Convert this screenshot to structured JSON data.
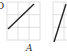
{
  "figure": {
    "panels": [
      {
        "label": "A",
        "grid": {
          "x0": 7,
          "y0": 2,
          "x1": 40,
          "y1": 40,
          "cols": 3,
          "rows": 3
        },
        "line": {
          "x1": 8,
          "y1": 29,
          "x2": 34,
          "y2": 4
        }
      },
      {
        "label": "",
        "grid": {
          "x0": 53,
          "y0": 2,
          "x1": 86,
          "y1": 40,
          "cols": 3,
          "rows": 3
        },
        "line": {
          "x1": 54,
          "y1": 42,
          "x2": 66,
          "y2": 4
        }
      }
    ],
    "cropped_glyph": "D",
    "colors": {
      "grid": "#d8d8d8",
      "line": "#222222",
      "text": "#333333"
    }
  }
}
